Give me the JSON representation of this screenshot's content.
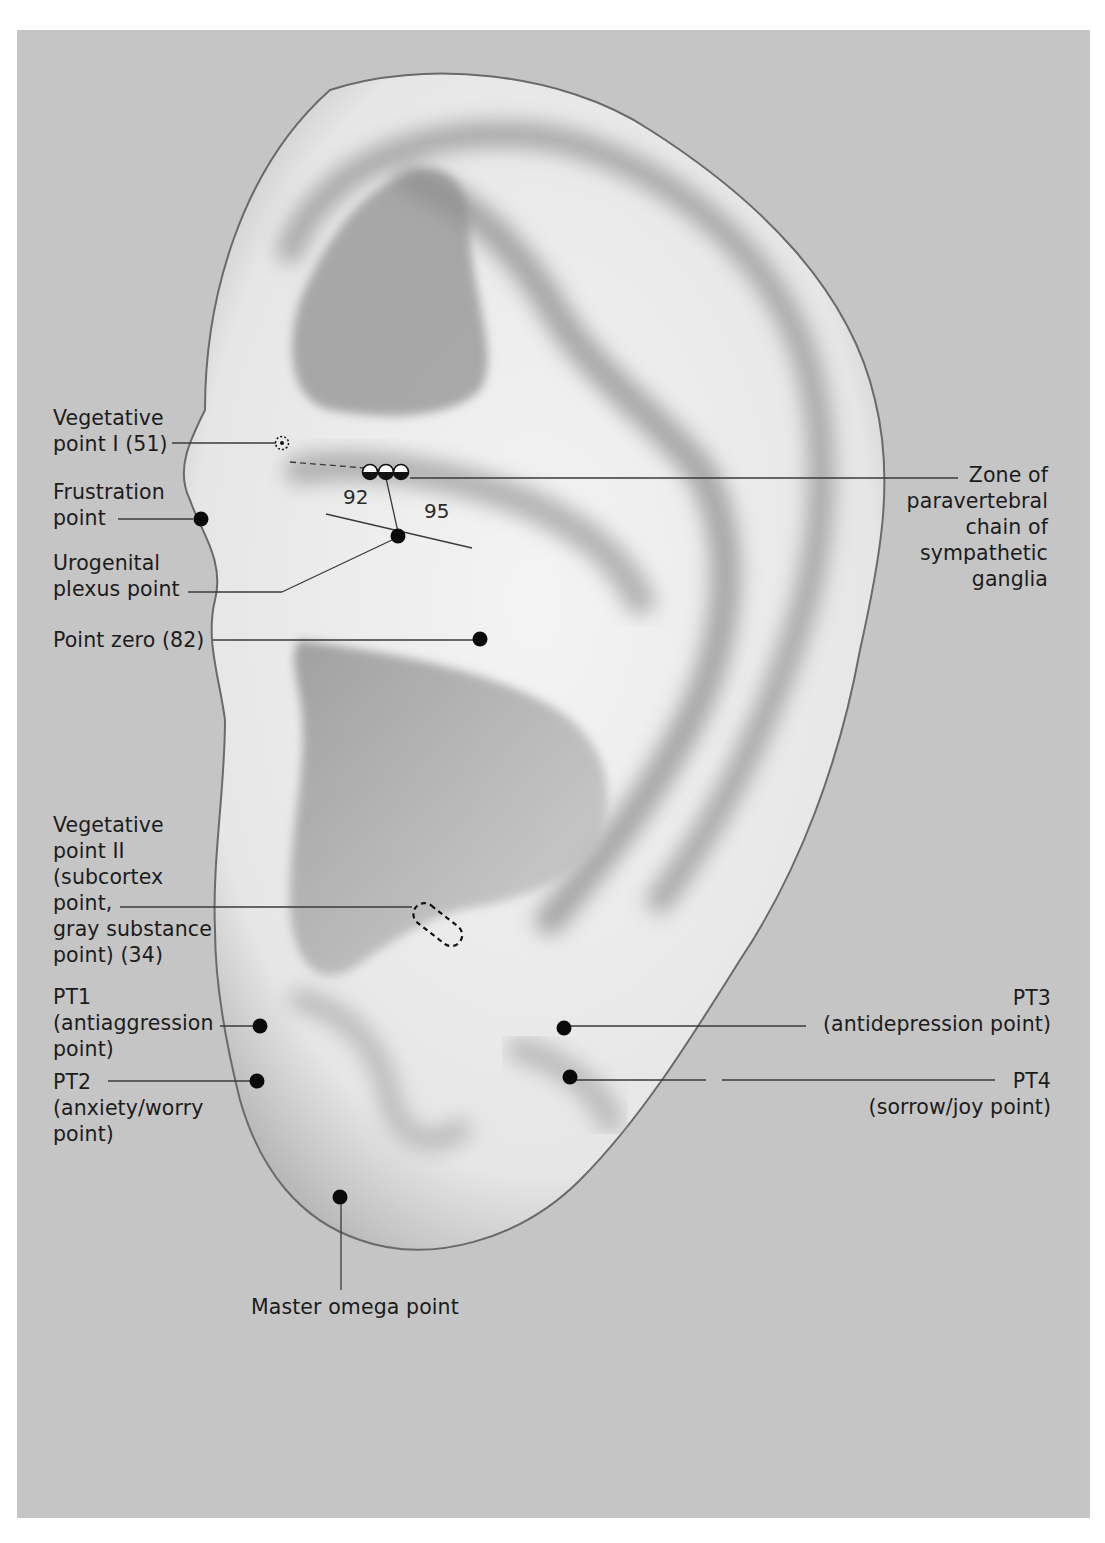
{
  "figure": {
    "background_color": "#c5c5c5",
    "point_color": "#0a0a0a"
  },
  "labels": {
    "vegetative_point_1": "Vegetative\npoint I (51)",
    "frustration_point": "Frustration\npoint",
    "urogenital_plexus_point": "Urogenital\nplexus point",
    "point_zero": "Point zero (82)",
    "vegetative_point_2": "Vegetative\npoint II\n(subcortex\npoint,\ngray substance\npoint) (34)",
    "pt1": "PT1\n(antiaggression\npoint)",
    "pt2": "PT2\n(anxiety/worry\npoint)",
    "pt3": "PT3\n(antidepression point)",
    "pt4": "PT4\n(sorrow/joy point)",
    "master_omega_point": "Master omega point",
    "paravertebral_zone": "Zone of\nparavertebral\nchain of\nsympathetic\nganglia"
  },
  "zone_numbers": {
    "n92": "92",
    "n95": "95"
  },
  "points": [
    {
      "id": "vegetative-point-1",
      "x": 282,
      "y": 443,
      "style": "dotted-circle"
    },
    {
      "id": "frustration-point",
      "x": 201,
      "y": 519,
      "style": "filled"
    },
    {
      "id": "urogenital-plexus-point",
      "x": 398,
      "y": 536,
      "style": "filled"
    },
    {
      "id": "point-zero",
      "x": 480,
      "y": 639,
      "style": "filled"
    },
    {
      "id": "vegetative-point-2",
      "x": 437,
      "y": 927,
      "style": "dashed-capsule"
    },
    {
      "id": "pt1",
      "x": 260,
      "y": 1026,
      "style": "filled"
    },
    {
      "id": "pt2",
      "x": 257,
      "y": 1081,
      "style": "filled"
    },
    {
      "id": "pt3",
      "x": 564,
      "y": 1028,
      "style": "filled"
    },
    {
      "id": "pt4",
      "x": 570,
      "y": 1077,
      "style": "filled"
    },
    {
      "id": "master-omega-point",
      "x": 340,
      "y": 1197,
      "style": "filled"
    },
    {
      "id": "paravertebral-chain-1",
      "x": 370,
      "y": 472,
      "style": "half-filled"
    },
    {
      "id": "paravertebral-chain-2",
      "x": 386,
      "y": 472,
      "style": "half-filled"
    },
    {
      "id": "paravertebral-chain-3",
      "x": 401,
      "y": 472,
      "style": "half-filled"
    }
  ]
}
